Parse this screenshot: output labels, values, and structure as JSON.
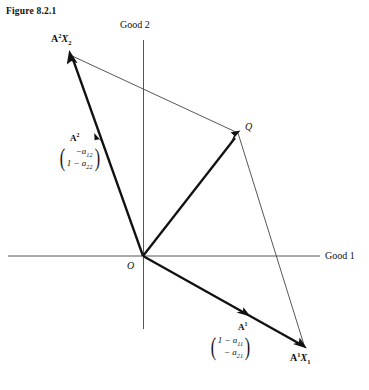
{
  "figure": {
    "caption": "Figure 8.2.1",
    "type": "vector-diagram"
  },
  "axes": {
    "horizontal": {
      "label": "Good 1",
      "name": "good-1-axis"
    },
    "vertical": {
      "label": "Good 2",
      "name": "good-2-axis"
    },
    "origin_label": "O"
  },
  "points": {
    "a2x2": {
      "label_html": "A<sup>2</sup><span class=\"ital\">X</span><sub>2</sub>",
      "x": 70,
      "y": 55
    },
    "a1x1": {
      "label_html": "A<sup>1</sup><span class=\"ital\">X</span><sub>1</sub>",
      "x": 305,
      "y": 348
    },
    "q": {
      "label": "Q",
      "x": 238,
      "y": 133
    },
    "origin": {
      "x": 143,
      "y": 256
    }
  },
  "vectors": [
    {
      "name": "A2",
      "label_html": "A<sup>2</sup>",
      "matrix_rows": [
        "&minus;a<sub>12</sub>",
        "1 &minus; a<sub>22</sub>"
      ],
      "from": "origin",
      "to": "a2x2"
    },
    {
      "name": "A1",
      "label_html": "A<sup>1</sup>",
      "matrix_rows": [
        "1 &minus; a<sub>11</sub>",
        "&minus; a<sub>21</sub>"
      ],
      "from": "origin",
      "to": "a1x1"
    },
    {
      "name": "OQ",
      "label_html": "",
      "matrix_rows": [],
      "from": "origin",
      "to": "q"
    }
  ],
  "colors": {
    "ink": "#111111",
    "axis": "#4a4a4a",
    "thin_line": "#555555",
    "background": "#ffffff"
  }
}
